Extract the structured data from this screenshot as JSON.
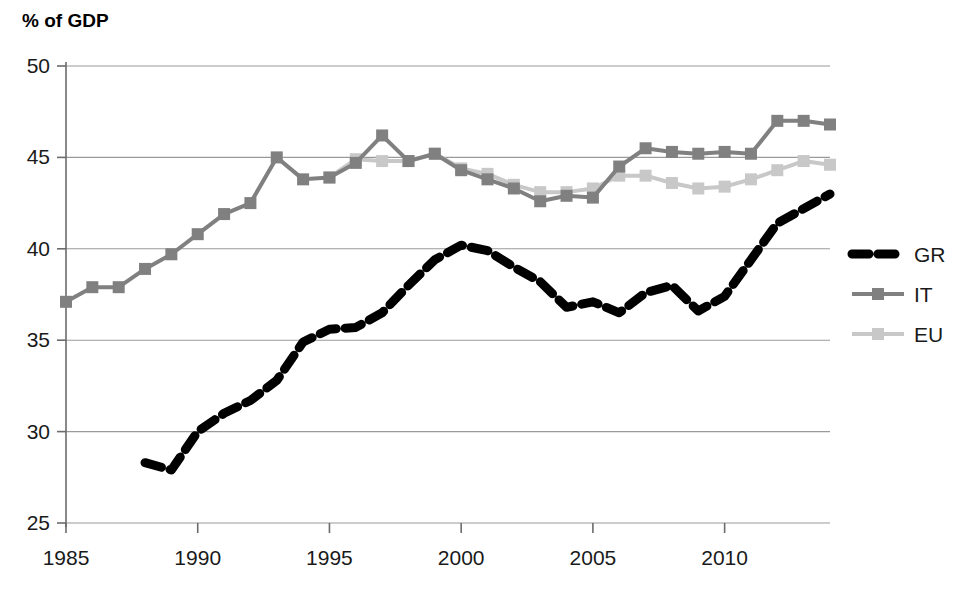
{
  "chart_data": {
    "type": "line",
    "title": "",
    "ylabel": "% of GDP",
    "xlabel": "",
    "ylim": [
      25,
      50
    ],
    "xlim": [
      1985,
      2014
    ],
    "ytick_values": [
      25,
      30,
      35,
      40,
      45,
      50
    ],
    "ytick_labels": [
      "25",
      "30",
      "35",
      "40",
      "45",
      "50"
    ],
    "xtick_values": [
      1985,
      1990,
      1995,
      2000,
      2005,
      2010
    ],
    "xtick_labels": [
      "1985",
      "1990",
      "1995",
      "2000",
      "2005",
      "2010"
    ],
    "grid": "horizontal",
    "legend_position": "right",
    "series": [
      {
        "name": "GR",
        "label": "GR",
        "color": "#000000",
        "style": "dashed",
        "marker": "none",
        "x": [
          1988,
          1989,
          1990,
          1991,
          1992,
          1993,
          1994,
          1995,
          1996,
          1997,
          1998,
          1999,
          2000,
          2001,
          2002,
          2003,
          2004,
          2005,
          2006,
          2007,
          2008,
          2009,
          2010,
          2011,
          2012,
          2013,
          2014
        ],
        "values": [
          28.3,
          27.9,
          30.0,
          31.0,
          31.7,
          32.8,
          34.9,
          35.6,
          35.7,
          36.5,
          38.0,
          39.4,
          40.2,
          39.9,
          39.0,
          38.2,
          36.8,
          37.1,
          36.5,
          37.6,
          38.0,
          36.6,
          37.4,
          39.4,
          41.4,
          42.2,
          43.0
        ]
      },
      {
        "name": "IT",
        "label": "IT",
        "color": "#808080",
        "style": "solid",
        "marker": "square",
        "x": [
          1985,
          1986,
          1987,
          1988,
          1989,
          1990,
          1991,
          1992,
          1993,
          1994,
          1995,
          1996,
          1997,
          1998,
          1999,
          2000,
          2001,
          2002,
          2003,
          2004,
          2005,
          2006,
          2007,
          2008,
          2009,
          2010,
          2011,
          2012,
          2013,
          2014
        ],
        "values": [
          37.1,
          37.9,
          37.9,
          38.9,
          39.7,
          40.8,
          41.9,
          42.5,
          45.0,
          43.8,
          43.9,
          44.7,
          46.2,
          44.8,
          45.2,
          44.3,
          43.8,
          43.3,
          42.6,
          42.9,
          42.8,
          44.5,
          45.5,
          45.3,
          45.2,
          45.3,
          45.2,
          47.0,
          47.0,
          46.8
        ]
      },
      {
        "name": "EU",
        "label": "EU",
        "color": "#c8c8c8",
        "style": "solid",
        "marker": "square",
        "x": [
          1995,
          1996,
          1997,
          1998,
          1999,
          2000,
          2001,
          2002,
          2003,
          2004,
          2005,
          2006,
          2007,
          2008,
          2009,
          2010,
          2011,
          2012,
          2013,
          2014
        ],
        "values": [
          43.9,
          44.9,
          44.8,
          44.8,
          45.2,
          44.4,
          44.1,
          43.5,
          43.1,
          43.1,
          43.3,
          44.0,
          44.0,
          43.6,
          43.3,
          43.4,
          43.8,
          44.3,
          44.8,
          44.6
        ]
      }
    ]
  },
  "legend": {
    "entries": [
      {
        "label": "GR"
      },
      {
        "label": "IT"
      },
      {
        "label": "EU"
      }
    ]
  },
  "axis": {
    "y_title": "% of GDP"
  }
}
